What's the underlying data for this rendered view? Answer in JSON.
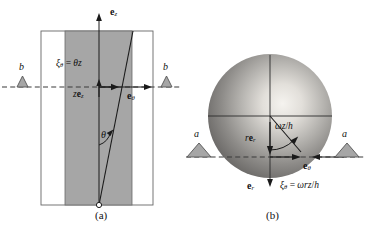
{
  "figure": {
    "panels": [
      {
        "id": "a",
        "caption": "(a)",
        "description": "side view of torsionally deformed cylinder",
        "labels": {
          "axis_vertical": "e_z",
          "axis_horizontal": "e_theta",
          "displacement": "xi_theta = theta z",
          "position": "z e_z",
          "angle": "theta",
          "edge_left": "b",
          "edge_right": "b"
        },
        "text": {
          "e_z_base": "e",
          "e_z_sub": "z",
          "e_theta_base": "e",
          "e_theta_sub": "θ",
          "xi_lead": "ξ",
          "xi_sub": "θ",
          "xi_eq": " = ",
          "xi_rhs_theta": "θ",
          "xi_rhs_z": "z",
          "ze_z_prefix": "z",
          "ze_z_base": "e",
          "ze_z_sub": "z",
          "angle_symbol": "θ",
          "b_left": "b",
          "b_right": "b"
        }
      },
      {
        "id": "b",
        "caption": "(b)",
        "description": "top view of sphere showing angular displacement",
        "labels": {
          "arc_label": "omega z / h",
          "radial": "r e_r",
          "unit_r": "e_r",
          "unit_theta": "e_theta",
          "displacement": "xi_theta = omega r z / h",
          "edge_left": "a",
          "edge_right": "a"
        },
        "text": {
          "arc_omega": "ω",
          "arc_z": "z",
          "arc_slash": "/",
          "arc_h": "h",
          "re_r_prefix": "r",
          "re_r_base": "e",
          "re_r_sub": "r",
          "e_r_base": "e",
          "e_r_sub": "r",
          "e_theta_base": "e",
          "e_theta_sub": "θ",
          "xi_lead": "ξ",
          "xi_sub": "θ",
          "xi_eq": " = ",
          "xi_rhs_omega": "ω",
          "xi_rhs_r": "r",
          "xi_rhs_z": "z",
          "xi_rhs_slash": "/",
          "xi_rhs_h": "h",
          "a_left": "a",
          "a_right": "a"
        }
      }
    ],
    "colors": {
      "shade_fill": "#a6a6a6",
      "outline": "#555555",
      "stroke": "#1a1a1a",
      "dashed": "#3a3a3a",
      "sphere_light": "#f2f0ec",
      "sphere_mid": "#9a9a9a",
      "sphere_dark": "#5a5a5a",
      "background": "#ffffff"
    }
  }
}
